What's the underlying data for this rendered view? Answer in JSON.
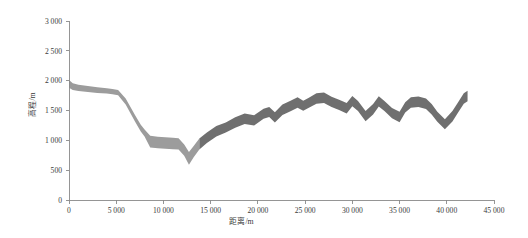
{
  "chart_data": {
    "type": "area",
    "title": "",
    "xlabel": "距离/m",
    "ylabel": "高程/m",
    "xlim": [
      0,
      45000
    ],
    "ylim": [
      0,
      3000
    ],
    "grid": false,
    "legend": null,
    "x_ticks": [
      0,
      5000,
      10000,
      15000,
      20000,
      25000,
      30000,
      35000,
      40000,
      45000
    ],
    "x_tick_labels": [
      "0",
      "5 000",
      "10 000",
      "15 000",
      "20 000",
      "25 000",
      "30 000",
      "35 000",
      "40 000",
      "45 000"
    ],
    "y_ticks": [
      0,
      500,
      1000,
      1500,
      2000,
      2500,
      3000
    ],
    "y_tick_labels": [
      "0",
      "500",
      "1 000",
      "1 500",
      "2 000",
      "2 500",
      "3 000"
    ],
    "segment_split_x": 13800,
    "colors": {
      "band_light": "#9c9c9c",
      "band_dark": "#6f6f6f",
      "axis": "#8a8a8a",
      "text": "#3a3a3a",
      "background": "#ffffff"
    },
    "series": [
      {
        "name": "上界高程",
        "role": "upper",
        "x": [
          0,
          400,
          1000,
          2000,
          3000,
          4000,
          4600,
          5200,
          6000,
          7000,
          7600,
          8000,
          8600,
          9400,
          10200,
          11000,
          11600,
          12200,
          12700,
          13200,
          13800,
          14600,
          15600,
          16600,
          17600,
          18600,
          19600,
          20600,
          21200,
          21800,
          22600,
          23400,
          24200,
          24800,
          25400,
          26200,
          27000,
          27800,
          28600,
          29400,
          30000,
          30600,
          31400,
          32200,
          32800,
          33400,
          34200,
          35000,
          35600,
          36200,
          37000,
          37800,
          38400,
          39000,
          39800,
          40600,
          41200,
          41800,
          42200
        ],
        "y": [
          2010,
          1955,
          1930,
          1910,
          1890,
          1875,
          1862,
          1845,
          1700,
          1420,
          1260,
          1180,
          1075,
          1060,
          1050,
          1042,
          1035,
          930,
          805,
          905,
          1030,
          1130,
          1240,
          1300,
          1385,
          1450,
          1420,
          1530,
          1560,
          1470,
          1600,
          1660,
          1720,
          1665,
          1715,
          1790,
          1800,
          1730,
          1680,
          1625,
          1745,
          1660,
          1490,
          1610,
          1740,
          1660,
          1540,
          1480,
          1640,
          1720,
          1735,
          1700,
          1610,
          1480,
          1355,
          1490,
          1640,
          1790,
          1830
        ]
      },
      {
        "name": "下界高程",
        "role": "lower",
        "x": [
          0,
          400,
          1000,
          2000,
          3000,
          4000,
          4600,
          5200,
          6000,
          7000,
          7600,
          8000,
          8600,
          9400,
          10200,
          11000,
          11600,
          12200,
          12700,
          13200,
          13800,
          14600,
          15600,
          16600,
          17600,
          18600,
          19600,
          20600,
          21200,
          21800,
          22600,
          23400,
          24200,
          24800,
          25400,
          26200,
          27000,
          27800,
          28600,
          29400,
          30000,
          30600,
          31400,
          32200,
          32800,
          33400,
          34200,
          35000,
          35600,
          36200,
          37000,
          37800,
          38400,
          39000,
          39800,
          40600,
          41200,
          41800,
          42200
        ],
        "y": [
          1880,
          1845,
          1825,
          1810,
          1795,
          1785,
          1772,
          1755,
          1600,
          1310,
          1150,
          1065,
          880,
          868,
          860,
          852,
          845,
          740,
          590,
          715,
          845,
          955,
          1065,
          1130,
          1210,
          1275,
          1250,
          1360,
          1390,
          1300,
          1425,
          1485,
          1545,
          1495,
          1545,
          1615,
          1625,
          1560,
          1510,
          1450,
          1570,
          1490,
          1320,
          1435,
          1565,
          1490,
          1370,
          1305,
          1465,
          1545,
          1560,
          1525,
          1435,
          1310,
          1185,
          1315,
          1465,
          1615,
          1655
        ]
      }
    ]
  }
}
